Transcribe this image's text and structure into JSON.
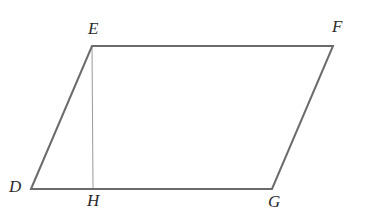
{
  "figure": {
    "kind": "geometry-diagram",
    "shape": "parallelogram",
    "name": "DEFG",
    "background_color": "#ffffff",
    "outline_color": "#6b6b6b",
    "altitude_color": "#9a9a9a",
    "label_color": "#2a2a2a",
    "outline_width": 2,
    "altitude_width": 1,
    "canvas": {
      "width": 365,
      "height": 211
    }
  },
  "vertices": [
    {
      "id": "E",
      "label": "E",
      "x": 92,
      "y": 46,
      "label_x": 88,
      "label_y": 20
    },
    {
      "id": "F",
      "label": "F",
      "x": 333,
      "y": 46,
      "label_x": 332,
      "label_y": 18
    },
    {
      "id": "G",
      "label": "G",
      "x": 272,
      "y": 189,
      "label_x": 268,
      "label_y": 193
    },
    {
      "id": "D",
      "label": "D",
      "x": 31,
      "y": 189,
      "label_x": 9,
      "label_y": 178
    },
    {
      "id": "H",
      "label": "H",
      "x": 93,
      "y": 189,
      "label_x": 87,
      "label_y": 192
    }
  ],
  "edges": [
    {
      "id": "EF",
      "from": "E",
      "to": "F",
      "role": "top-side",
      "style": "solid"
    },
    {
      "id": "FG",
      "from": "F",
      "to": "G",
      "role": "right-side",
      "style": "solid"
    },
    {
      "id": "GD",
      "from": "G",
      "to": "D",
      "role": "bottom-side",
      "style": "solid"
    },
    {
      "id": "DE",
      "from": "D",
      "to": "E",
      "role": "left-side",
      "style": "solid"
    },
    {
      "id": "EH",
      "from": "E",
      "to": "H",
      "role": "altitude",
      "style": "solid"
    }
  ],
  "labels": {
    "E": "E",
    "F": "F",
    "D": "D",
    "H": "H",
    "G": "G"
  }
}
